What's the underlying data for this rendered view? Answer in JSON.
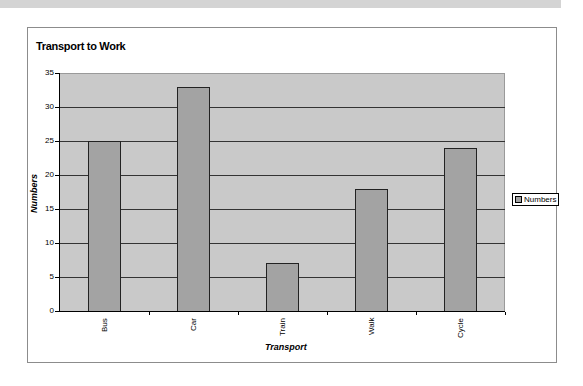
{
  "chart_data": {
    "type": "bar",
    "title": "Transport to Work",
    "xlabel": "Transport",
    "ylabel": "Numbers",
    "categories": [
      "Bus",
      "Car",
      "Train",
      "Walk",
      "Cycle"
    ],
    "series": [
      {
        "name": "Numbers",
        "values": [
          25,
          33,
          7,
          18,
          24
        ]
      }
    ],
    "values": [
      25,
      33,
      7,
      18,
      24
    ],
    "ylim": [
      0,
      35
    ],
    "yticks": [
      "0",
      "5",
      "10",
      "15",
      "20",
      "25",
      "30",
      "35"
    ],
    "grid": true,
    "legend_position": "right",
    "colors": {
      "bar": "#a3a3a3",
      "plot_bg": "#c9c9c9",
      "gridline": "#333333"
    }
  },
  "legend": {
    "label": "Numbers"
  }
}
